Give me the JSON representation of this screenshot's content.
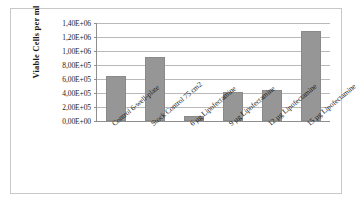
{
  "chart_data": {
    "type": "bar",
    "title": "",
    "xlabel": "",
    "ylabel": "Viable Cells per  ml",
    "categories": [
      "Control 6-well-plate",
      "Stock Control 75 cm2",
      "6 µg Lipofectamine",
      "9 µg Lipofectamine",
      "12 µg Lipofectamine",
      "15 µg Lipofectamine"
    ],
    "values": [
      640000,
      920000,
      70000,
      410000,
      445000,
      1290000
    ],
    "ylim": [
      0,
      1400000
    ],
    "ytick_values": [
      0,
      200000,
      400000,
      600000,
      800000,
      1000000,
      1200000,
      1400000
    ],
    "ytick_labels": [
      "0,00E+00",
      "2,00E+05",
      "4,00E+05",
      "6,00E+05",
      "8,00E+05",
      "1,00E+06",
      "1,20E+06",
      "1,40E+06"
    ],
    "grid": true,
    "legend": false,
    "series_color": "#969696",
    "gridline_color": "#b9b9b9",
    "axis_color": "#8e8e8e",
    "border_color": "#c8c8c8"
  }
}
